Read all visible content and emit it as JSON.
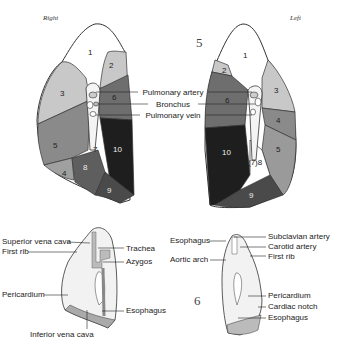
{
  "top_figure": {
    "number": "5",
    "right_lung": {
      "side_label": "Right",
      "segments": [
        "1",
        "2",
        "3",
        "4",
        "5",
        "6",
        "7",
        "8",
        "9",
        "10"
      ]
    },
    "left_lung": {
      "side_label": "Left",
      "segments": [
        "1",
        "2",
        "3",
        "4",
        "5",
        "6",
        "(7)8",
        "9",
        "10"
      ]
    },
    "hilum_labels": [
      "Pulmonary artery",
      "Bronchus",
      "Pulmonary vein"
    ]
  },
  "bottom_figure": {
    "number": "6",
    "right_medial": {
      "labels": {
        "superior_vena_cava": "Superior vena cava",
        "first_rib": "First rib",
        "trachea": "Trachea",
        "azygos": "Azygos",
        "pericardium": "Pericardium",
        "esophagus": "Esophagus",
        "inferior_vena_cava": "Inferior vena cava"
      }
    },
    "left_medial": {
      "labels": {
        "esophagus_top": "Esophagus",
        "subclavian_artery": "Subclavian artery",
        "carotid_artery": "Carotid artery",
        "first_rib": "First rib",
        "aortic_arch": "Aortic arch",
        "pericardium": "Pericardium",
        "cardiac_notch": "Cardiac notch",
        "esophagus_bottom": "Esophagus"
      }
    }
  },
  "colors": {
    "white": "#ffffff",
    "light": "#c8c8c8",
    "mid": "#8a8a8a",
    "dark": "#5e5e5e",
    "darker": "#3e3e3e",
    "darkest": "#1e1e1e"
  }
}
